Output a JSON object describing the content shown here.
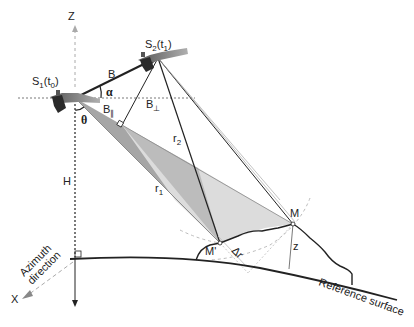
{
  "diagram": {
    "labels": {
      "z_axis": "Z",
      "x_axis": "X",
      "azimuth": "Azimuth direction",
      "azimuth_line1": "Azimuth",
      "azimuth_line2": "direction",
      "sat1": "S",
      "sat1_sub": "1",
      "sat1_time": "(t",
      "sat1_time_sub": "0",
      "sat1_close": ")",
      "sat2": "S",
      "sat2_sub": "2",
      "sat2_time": "(t",
      "sat2_time_sub": "1",
      "sat2_close": ")",
      "baseline": "B",
      "alpha": "α",
      "theta": "θ",
      "b_perp": "B",
      "b_perp_sub": "⊥",
      "b_par": "B",
      "b_par_sub": "∥",
      "height": "H",
      "r1": "r",
      "r1_sub": "1",
      "r2": "r",
      "r2_sub": "2",
      "point_m": "M",
      "point_m_prime": "M'",
      "delta_r": "Δr",
      "elevation": "z",
      "reference_surface": "Reference surface"
    },
    "colors": {
      "line": "#222222",
      "light_line": "#888888",
      "dash": "#aaaaaa",
      "dark_fill": "#a6a6a6",
      "light_fill": "#dcdcdc",
      "satellite": "#3a3a3a",
      "panel": "#7a7a7a"
    }
  }
}
